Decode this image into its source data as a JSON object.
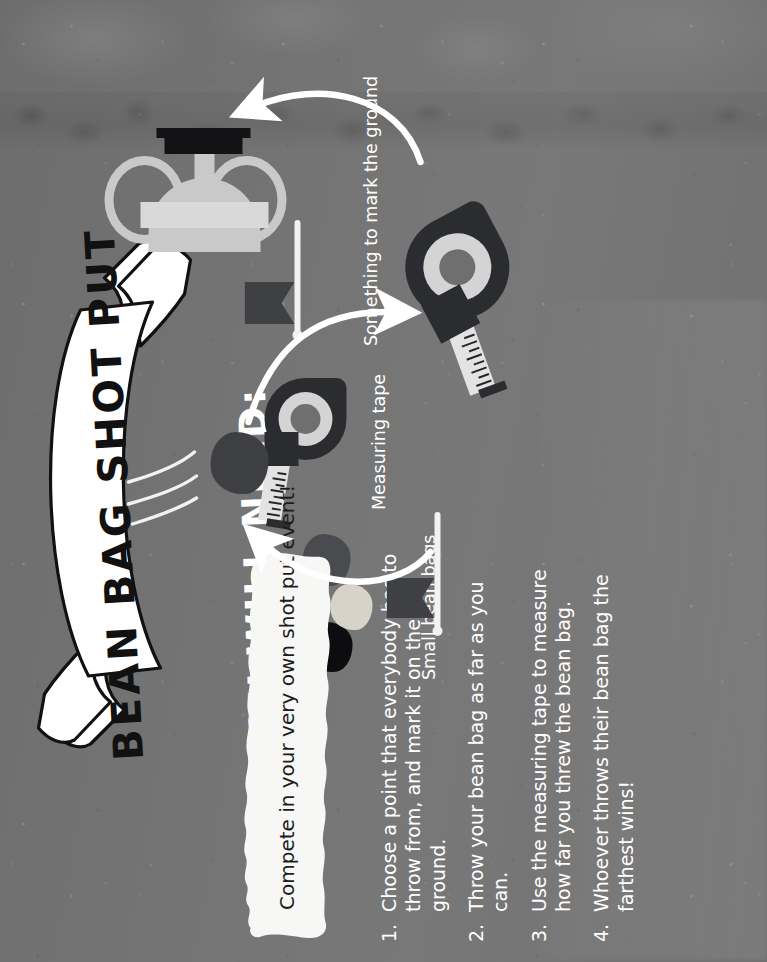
{
  "poster": {
    "title": "BEAN BAG SHOT PUT",
    "tagline": "Compete in your very own shot put event!",
    "supplies_heading": "YOU WILL NEED:",
    "background_color": "#727272",
    "text_color": "#ffffff",
    "banner_color": "#ffffff",
    "ink_color": "#111111"
  },
  "supplies": [
    {
      "label": "Small bean bags",
      "icon": "bean-bags-icon",
      "colors": [
        "#4a4b4e",
        "#d8d3c8",
        "#0d0d0f"
      ]
    },
    {
      "label": "Measuring tape",
      "icon": "measuring-tape-icon",
      "colors": [
        "#2b2c2f",
        "#d4d4d4",
        "#6f6f6f"
      ]
    },
    {
      "label": "Something to mark the ground",
      "icon": "flag-marker-icon",
      "colors": [
        "#3f4043",
        "#f2f2f2"
      ]
    }
  ],
  "steps": [
    {
      "number": "1.",
      "text": "Choose a point that everybody has to throw from, and mark it on the ground."
    },
    {
      "number": "2.",
      "text": "Throw your bean bag as far as you can."
    },
    {
      "number": "3.",
      "text": "Use the measuring tape to measure how far you threw the bean bag."
    },
    {
      "number": "4.",
      "text": "Whoever throws their bean bag the farthest wins!"
    }
  ],
  "diagram": {
    "nodes": [
      {
        "name": "start-flag-marker",
        "icon": "flag-marker-icon"
      },
      {
        "name": "thrown-bean-bag",
        "icon": "bean-bag-icon"
      },
      {
        "name": "measuring-tape",
        "icon": "measuring-tape-icon"
      },
      {
        "name": "trophy",
        "icon": "trophy-icon"
      }
    ],
    "arrows": [
      {
        "name": "arrow-flag-to-bag",
        "from": "start-flag-marker",
        "to": "thrown-bean-bag"
      },
      {
        "name": "arrow-bag-to-tape",
        "from": "thrown-bean-bag",
        "to": "measuring-tape"
      },
      {
        "name": "arrow-tape-to-trophy",
        "from": "measuring-tape",
        "to": "trophy"
      }
    ]
  }
}
